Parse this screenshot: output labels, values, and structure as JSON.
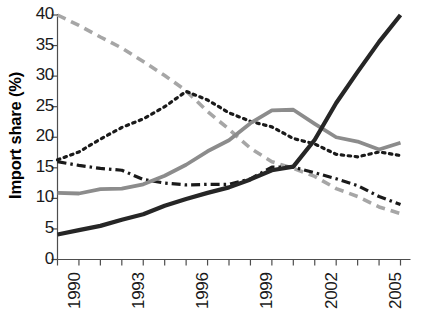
{
  "chart_data": {
    "type": "line",
    "title": "",
    "xlabel": "",
    "ylabel": "Import share (%)",
    "xlim": [
      1990,
      2006
    ],
    "ylim": [
      0,
      40
    ],
    "grid": false,
    "legend": "none",
    "y_ticks": [
      0,
      5,
      10,
      15,
      20,
      25,
      30,
      35,
      40
    ],
    "y_tick_labels": [
      "0",
      "5",
      "10",
      "15",
      "20",
      "25",
      "30",
      "35",
      "40"
    ],
    "x_ticks": [
      1990,
      1991,
      1992,
      1993,
      1994,
      1995,
      1996,
      1997,
      1998,
      1999,
      2000,
      2001,
      2002,
      2003,
      2004,
      2005,
      2006
    ],
    "x_tick_labels": [
      "1990",
      "",
      "",
      "1993",
      "",
      "",
      "1996",
      "",
      "",
      "1999",
      "",
      "",
      "2002",
      "",
      "",
      "2005",
      ""
    ],
    "x_labeled_ticks": [
      "1990",
      "1993",
      "1996",
      "1999",
      "2002",
      "2005"
    ],
    "x": [
      1990,
      1991,
      1992,
      1993,
      1994,
      1995,
      1996,
      1997,
      1998,
      1999,
      2000,
      2001,
      2002,
      2003,
      2004,
      2005,
      2006
    ],
    "series": [
      {
        "name": "series-gray-dashed",
        "style": "dashed",
        "color": "#a6a6a6",
        "width": 3.6,
        "dasharray": "9,6",
        "values": [
          40.0,
          38.3,
          36.4,
          34.6,
          32.4,
          30.1,
          27.6,
          24.2,
          21.3,
          18.2,
          16.0,
          14.9,
          13.6,
          11.6,
          10.3,
          8.6,
          7.5
        ]
      },
      {
        "name": "series-black-dotted",
        "style": "dotted",
        "color": "#1a1a1a",
        "width": 3.2,
        "dasharray": "2.5,4.5",
        "values": [
          16.3,
          17.6,
          19.7,
          21.6,
          23.0,
          25.0,
          27.5,
          26.1,
          24.0,
          22.6,
          21.7,
          19.8,
          18.9,
          17.2,
          16.8,
          17.6,
          17.0
        ]
      },
      {
        "name": "series-black-dashdot",
        "style": "dashdot",
        "color": "#1a1a1a",
        "width": 3.2,
        "dasharray": "9,4,2.5,4",
        "values": [
          16.0,
          15.4,
          14.9,
          14.6,
          13.1,
          12.5,
          12.2,
          12.3,
          12.3,
          13.2,
          15.1,
          15.1,
          14.2,
          13.2,
          12.1,
          10.3,
          9.0
        ]
      },
      {
        "name": "series-gray-solid",
        "style": "solid",
        "color": "#8c8c8c",
        "width": 3.8,
        "dasharray": "none",
        "values": [
          10.9,
          10.8,
          11.5,
          11.6,
          12.3,
          13.7,
          15.5,
          17.7,
          19.5,
          22.3,
          24.4,
          24.5,
          22.2,
          20.0,
          19.3,
          18.0,
          19.1
        ]
      },
      {
        "name": "series-black-solid",
        "style": "solid",
        "color": "#262626",
        "width": 4.2,
        "dasharray": "none",
        "values": [
          4.1,
          4.8,
          5.5,
          6.5,
          7.4,
          8.8,
          9.9,
          10.9,
          11.8,
          13.1,
          14.6,
          15.2,
          19.6,
          25.6,
          30.7,
          35.6,
          40.0
        ]
      }
    ]
  },
  "axis": {
    "y_label_text": "Import share (%)"
  }
}
